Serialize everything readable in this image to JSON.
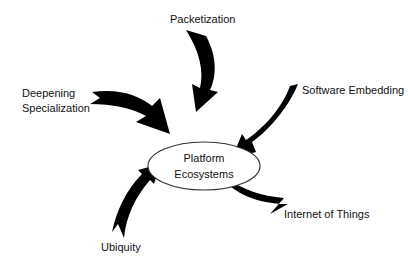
{
  "diagram": {
    "center": {
      "line1": "Platform",
      "line2": "Ecosystems"
    },
    "drivers": [
      {
        "id": "packetization",
        "label": "Packetization"
      },
      {
        "id": "deepening-specialization",
        "line1": "Deepening",
        "line2": "Specialization"
      },
      {
        "id": "software-embedding",
        "label": "Software Embedding"
      },
      {
        "id": "internet-of-things",
        "label": "Internet of Things"
      },
      {
        "id": "ubiquity",
        "label": "Ubiquity"
      }
    ],
    "colors": {
      "arrow": "#000000",
      "ellipse_stroke": "#333333",
      "text": "#111111",
      "background": "#ffffff"
    }
  }
}
